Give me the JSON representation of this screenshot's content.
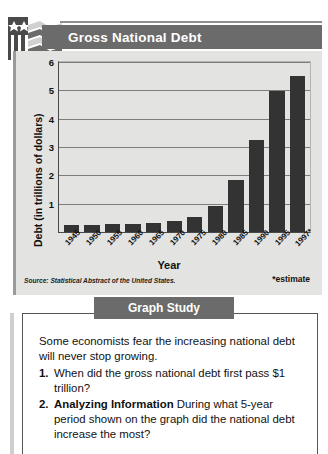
{
  "header": {
    "title": "Gross National Debt",
    "logo_icon": "usa-flag-icon"
  },
  "chart_data": {
    "type": "bar",
    "title": "Gross National Debt",
    "xlabel": "Year",
    "ylabel": "Debt (in trillions of dollars)",
    "categories": [
      "1945",
      "1950",
      "1955",
      "1960",
      "1965",
      "1970",
      "1975",
      "1980",
      "1985",
      "1990",
      "1995",
      "1997*"
    ],
    "values": [
      0.26,
      0.26,
      0.27,
      0.29,
      0.32,
      0.38,
      0.54,
      0.91,
      1.82,
      3.23,
      4.97,
      5.5
    ],
    "ylim": [
      0,
      6
    ],
    "yticks": [
      1,
      2,
      3,
      4,
      5,
      6
    ],
    "grid": true,
    "legend": "none",
    "bar_color": "#333333",
    "plot_background": "#e3e3e1",
    "source": "Source: Statistical Abstract of the United States.",
    "footnote": "*estimate"
  },
  "study": {
    "banner": "Graph Study",
    "intro": "Some economists fear the increasing national debt will never stop growing.",
    "questions": [
      {
        "num": "1.",
        "emph": "",
        "text": "When did the gross national debt first pass $1 trillion?"
      },
      {
        "num": "2.",
        "emph": "Analyzing Information",
        "text": "During what 5-year period shown on the graph did the national debt increase the most?"
      }
    ]
  }
}
